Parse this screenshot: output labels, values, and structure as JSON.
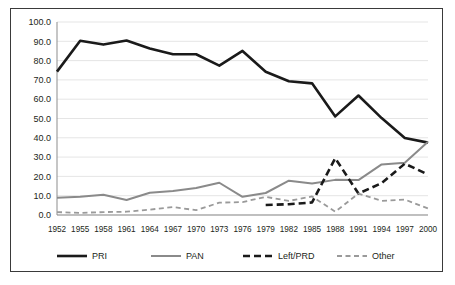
{
  "figure": {
    "frame_color": "#3a3a3a",
    "background": "#ffffff"
  },
  "chart_data": {
    "type": "line",
    "title": "",
    "subtitle": "",
    "xlabel": "",
    "ylabel": "",
    "categories": [
      "1952",
      "1955",
      "1958",
      "1961",
      "1964",
      "1967",
      "1970",
      "1973",
      "1976",
      "1979",
      "1982",
      "1985",
      "1988",
      "1991",
      "1994",
      "1997",
      "2000"
    ],
    "ylim": [
      0,
      100
    ],
    "ytick_labels": [
      "0.0",
      "10.0",
      "20.0",
      "30.0",
      "40.0",
      "50.0",
      "60.0",
      "70.0",
      "80.0",
      "90.0",
      "100.0"
    ],
    "ytick_values": [
      0,
      10,
      20,
      30,
      40,
      50,
      60,
      70,
      80,
      90,
      100
    ],
    "grid": true,
    "grid_axis": "y",
    "legend_position": "bottom",
    "series": [
      {
        "name": "PRI",
        "color": "#1a1a1a",
        "style": "solid",
        "width": 2.6,
        "x": [
          "1952",
          "1955",
          "1958",
          "1961",
          "1964",
          "1967",
          "1970",
          "1973",
          "1976",
          "1979",
          "1982",
          "1985",
          "1988",
          "1991",
          "1994",
          "1997",
          "2000"
        ],
        "values": [
          74.3,
          90.3,
          88.3,
          90.4,
          86.3,
          83.3,
          83.3,
          77.4,
          85.0,
          74.2,
          69.3,
          68.2,
          51.1,
          61.9,
          50.2,
          39.9,
          37.5
        ]
      },
      {
        "name": "PAN",
        "color": "#8a8a8a",
        "style": "solid",
        "width": 2.0,
        "x": [
          "1952",
          "1955",
          "1958",
          "1961",
          "1964",
          "1967",
          "1970",
          "1973",
          "1976",
          "1979",
          "1982",
          "1985",
          "1988",
          "1991",
          "1994",
          "1997",
          "2000"
        ],
        "values": [
          8.9,
          9.4,
          10.5,
          7.8,
          11.5,
          12.4,
          14.0,
          16.7,
          9.4,
          11.4,
          17.8,
          16.3,
          18.2,
          18.1,
          26.2,
          27.1,
          38.0
        ]
      },
      {
        "name": "Left/PRD",
        "color": "#1a1a1a",
        "style": "dashed",
        "width": 2.6,
        "x": [
          "1979",
          "1982",
          "1985",
          "1988",
          "1991",
          "1994",
          "1997",
          "2000"
        ],
        "values": [
          5.2,
          5.6,
          6.5,
          29.4,
          11.1,
          16.5,
          26.6,
          21.0
        ]
      },
      {
        "name": "Other",
        "color": "#9a9a9a",
        "style": "dashed",
        "width": 1.8,
        "x": [
          "1952",
          "1955",
          "1958",
          "1961",
          "1964",
          "1967",
          "1970",
          "1973",
          "1976",
          "1979",
          "1982",
          "1985",
          "1988",
          "1991",
          "1994",
          "1997",
          "2000"
        ],
        "values": [
          1.5,
          1.1,
          1.5,
          1.7,
          2.8,
          4.1,
          2.5,
          6.4,
          6.7,
          9.4,
          7.3,
          9.6,
          1.7,
          11.1,
          7.3,
          8.0,
          3.4
        ]
      }
    ]
  },
  "legend": {
    "items": [
      {
        "label": "PRI"
      },
      {
        "label": "PAN"
      },
      {
        "label": "Left/PRD"
      },
      {
        "label": "Other"
      }
    ]
  }
}
